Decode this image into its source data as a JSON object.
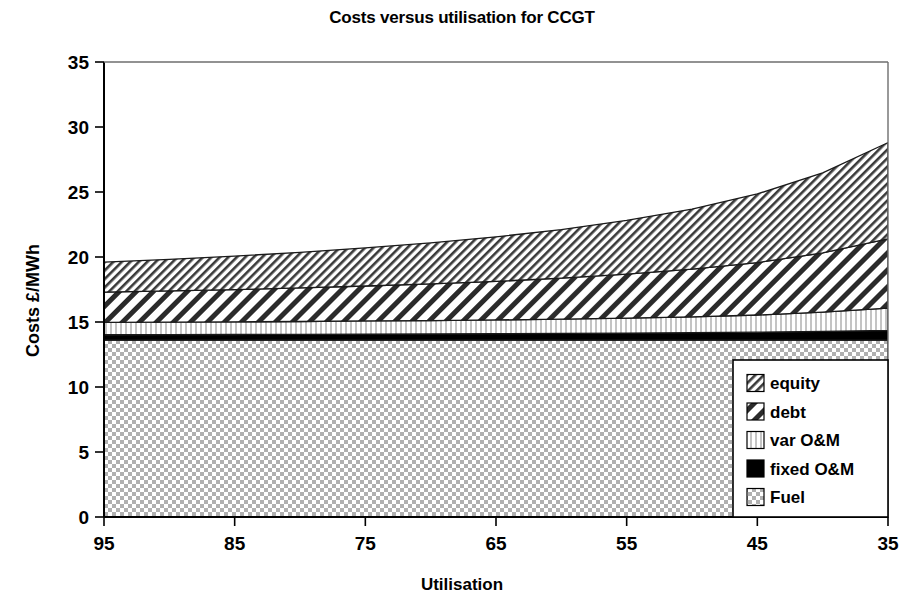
{
  "chart_data": {
    "type": "area",
    "title": "Costs versus utilisation for CCGT",
    "xlabel": "Utilisation",
    "ylabel": "Costs £/MWh",
    "stacked": true,
    "grid": false,
    "legend_position": "bottom-right",
    "xlim": [
      95,
      35
    ],
    "ylim": [
      0,
      35
    ],
    "x_ticks": [
      "95",
      "85",
      "75",
      "65",
      "55",
      "45",
      "35"
    ],
    "y_ticks": [
      "0",
      "5",
      "10",
      "15",
      "20",
      "25",
      "30",
      "35"
    ],
    "x": [
      95,
      90,
      85,
      80,
      75,
      70,
      65,
      60,
      55,
      50,
      45,
      40,
      35
    ],
    "series": [
      {
        "name": "Fuel",
        "pattern": "checker",
        "values": [
          13.6,
          13.6,
          13.6,
          13.6,
          13.6,
          13.6,
          13.6,
          13.6,
          13.6,
          13.6,
          13.6,
          13.6,
          13.6
        ]
      },
      {
        "name": "fixed O&M",
        "pattern": "solid-black",
        "values": [
          0.42,
          0.43,
          0.44,
          0.45,
          0.47,
          0.48,
          0.5,
          0.52,
          0.55,
          0.58,
          0.62,
          0.68,
          0.75
        ]
      },
      {
        "name": "var O&M",
        "pattern": "vertical-stripes",
        "values": [
          0.95,
          0.96,
          0.97,
          0.99,
          1.01,
          1.03,
          1.06,
          1.1,
          1.15,
          1.22,
          1.32,
          1.48,
          1.72
        ]
      },
      {
        "name": "debt",
        "pattern": "diagonal-wide",
        "values": [
          2.33,
          2.4,
          2.48,
          2.58,
          2.69,
          2.82,
          2.97,
          3.15,
          3.38,
          3.66,
          4.03,
          4.55,
          5.33
        ]
      },
      {
        "name": "equity",
        "pattern": "diagonal-fine",
        "values": [
          2.3,
          2.43,
          2.58,
          2.74,
          2.93,
          3.15,
          3.42,
          3.74,
          4.13,
          4.63,
          5.28,
          6.16,
          7.4
        ]
      }
    ],
    "cumulative_top": [
      19.6,
      19.82,
      20.07,
      20.36,
      20.7,
      21.08,
      21.55,
      22.11,
      22.81,
      23.69,
      24.85,
      26.47,
      28.8
    ],
    "legend_entries": [
      {
        "label": "equity",
        "pattern": "diagonal-fine"
      },
      {
        "label": "debt",
        "pattern": "diagonal-wide"
      },
      {
        "label": "var O&M",
        "pattern": "vertical-stripes"
      },
      {
        "label": "fixed O&M",
        "pattern": "solid-black"
      },
      {
        "label": "Fuel",
        "pattern": "checker"
      }
    ]
  }
}
